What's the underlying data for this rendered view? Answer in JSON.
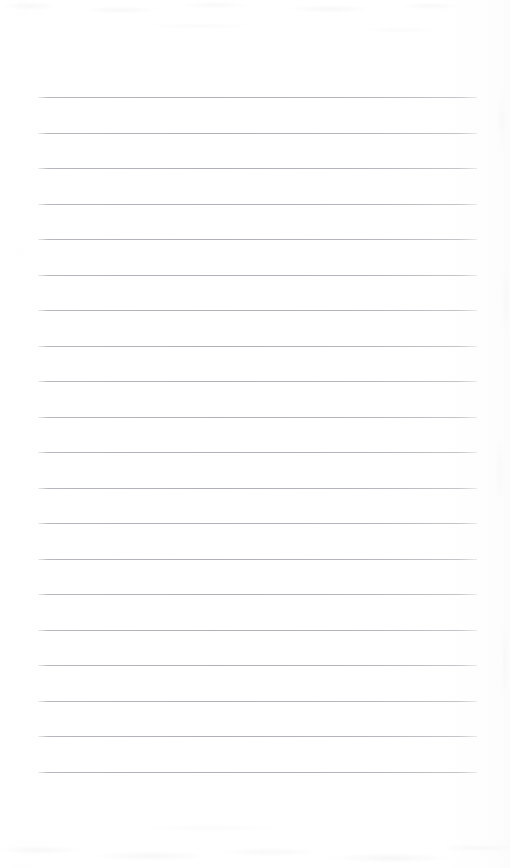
{
  "document": {
    "type": "scanned-ruled-notepad-page",
    "title": "",
    "body_text": "",
    "page_width": 510,
    "page_height": 868,
    "background_color": "#ffffff",
    "has_handwriting": false,
    "has_printed_text": false
  },
  "ruling": {
    "line_color": "#b0b0b6",
    "line_thickness_px": 1,
    "line_count": 20,
    "left_x": 38,
    "right_x": 477,
    "line_width": 439,
    "first_line_y": 97,
    "line_spacing_px": 35.5,
    "top_margin_px": 97,
    "bottom_margin_px": 96,
    "left_margin_px": 38,
    "right_margin_px": 33,
    "line_y_positions": [
      97,
      132.5,
      168,
      203.5,
      239,
      274.5,
      310,
      345.5,
      381,
      416.5,
      452,
      487.5,
      523,
      558.5,
      594,
      629.5,
      665,
      700.5,
      736,
      771.5
    ]
  },
  "texture": {
    "paper_tone": "#ffffff",
    "noise_tone": "#f2f2f3",
    "edge_tone": "#fbfbfb",
    "noise_regions": [
      "top-edge",
      "bottom-edge",
      "right-edge"
    ]
  }
}
